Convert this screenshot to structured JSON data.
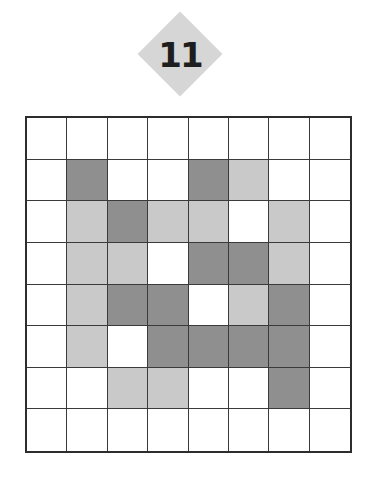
{
  "puzzle": {
    "number": "11",
    "grid_size": 8,
    "colors": {
      "W": "#ffffff",
      "L": "#c9c9c9",
      "D": "#8f8f8f"
    },
    "grid": [
      [
        "W",
        "W",
        "W",
        "W",
        "W",
        "W",
        "W",
        "W"
      ],
      [
        "W",
        "D",
        "W",
        "W",
        "D",
        "L",
        "W",
        "W"
      ],
      [
        "W",
        "L",
        "D",
        "L",
        "L",
        "W",
        "L",
        "W"
      ],
      [
        "W",
        "L",
        "L",
        "W",
        "D",
        "D",
        "L",
        "W"
      ],
      [
        "W",
        "L",
        "D",
        "D",
        "W",
        "L",
        "D",
        "W"
      ],
      [
        "W",
        "L",
        "W",
        "D",
        "D",
        "D",
        "D",
        "W"
      ],
      [
        "W",
        "W",
        "L",
        "L",
        "W",
        "W",
        "D",
        "W"
      ],
      [
        "W",
        "W",
        "W",
        "W",
        "W",
        "W",
        "W",
        "W"
      ]
    ]
  }
}
